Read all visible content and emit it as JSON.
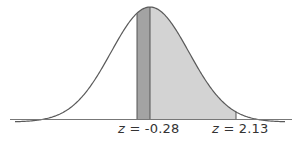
{
  "chart_data": {
    "type": "area",
    "title": "",
    "distribution": "standard normal",
    "shaded_region": {
      "from_z": -0.28,
      "to_z": 2.13
    },
    "dark_band": {
      "from_z": -0.28,
      "to_z": 0
    },
    "labels": [
      {
        "var": "z",
        "eq": "=",
        "value": "-0.28"
      },
      {
        "var": "z",
        "eq": "=",
        "value": "2.13"
      }
    ],
    "colors": {
      "curve": "#555555",
      "light_fill": "#d0d0d0",
      "dark_fill": "#a0a0a0",
      "axis": "#666666"
    }
  }
}
